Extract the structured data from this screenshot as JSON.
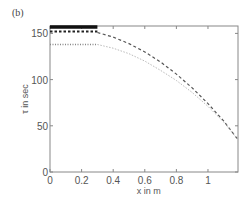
{
  "panel_label": "(b)",
  "chart_data": {
    "type": "line",
    "title": "",
    "panel": "(b)",
    "xlabel": "x in m",
    "ylabel": "τ in sec",
    "xlim": [
      0,
      1.19
    ],
    "ylim": [
      0,
      158
    ],
    "xticks": [
      0,
      0.2,
      0.4,
      0.6,
      0.8,
      1
    ],
    "xtick_labels": [
      "0",
      "0.2",
      "0.4",
      "0.6",
      "0.8",
      "1"
    ],
    "yticks": [
      0,
      50,
      100,
      150
    ],
    "ytick_labels": [
      "0",
      "50",
      "100",
      "150"
    ],
    "grid": false,
    "legend": null,
    "series": [
      {
        "name": "thick solid segment",
        "style": "solid-thick",
        "color": "#111111",
        "x": [
          0,
          0.3
        ],
        "y": [
          157,
          157
        ]
      },
      {
        "name": "dotted square-marker segment",
        "style": "dotted-squares",
        "color": "#222222",
        "x": [
          0,
          0.3
        ],
        "y": [
          152,
          152
        ]
      },
      {
        "name": "hatched gray segment",
        "style": "dash-dot-gray",
        "color": "#888888",
        "x": [
          0,
          0.3
        ],
        "y": [
          138,
          138
        ]
      },
      {
        "name": "dashed decay curve",
        "style": "dashed",
        "color": "#555555",
        "x": [
          0.3,
          0.4,
          0.5,
          0.6,
          0.7,
          0.8,
          0.9,
          1.0,
          1.1,
          1.19
        ],
        "y": [
          151,
          146,
          139,
          130,
          119,
          106,
          91,
          74,
          55,
          35
        ]
      },
      {
        "name": "light dotted decay curve",
        "style": "dotted-light",
        "color": "#bbbbbb",
        "x": [
          0.3,
          0.4,
          0.5,
          0.6,
          0.7,
          0.8,
          0.9,
          1.0,
          1.1,
          1.19
        ],
        "y": [
          138,
          134,
          128,
          120,
          110,
          99,
          86,
          71,
          54,
          35
        ]
      }
    ]
  }
}
